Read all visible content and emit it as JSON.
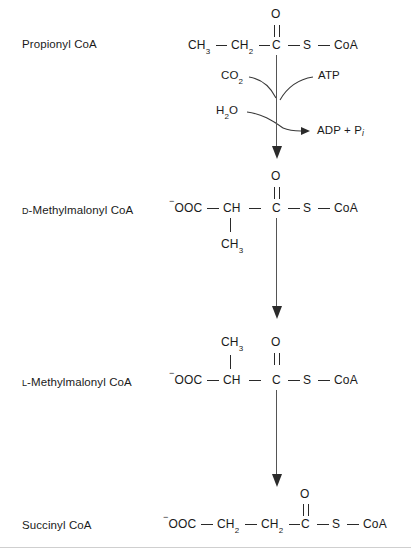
{
  "diagram": {
    "line_color": "#2a2a2a",
    "background": "#ffffff"
  },
  "compounds": [
    {
      "id": "propionyl",
      "label_prefix": "",
      "label": "Propionyl CoA"
    },
    {
      "id": "d-methylmalonyl",
      "label_prefix": "D",
      "label": "-Methylmalonyl CoA"
    },
    {
      "id": "l-methylmalonyl",
      "label_prefix": "L",
      "label": "-Methylmalonyl CoA"
    },
    {
      "id": "succinyl",
      "label_prefix": "",
      "label": "Succinyl CoA"
    }
  ],
  "structures": {
    "propionyl": {
      "carbonyl_oxygen": "O",
      "atoms": [
        "CH",
        "CH",
        "C",
        "S",
        "CoA"
      ],
      "atom_1": "CH",
      "atom_1_sub": "3",
      "atom_2": "CH",
      "atom_2_sub": "2",
      "atom_3": "C",
      "atom_4": "S",
      "atom_5": "CoA"
    },
    "d_methylmalonyl": {
      "carbonyl_oxygen": "O",
      "charge": "−",
      "atom_1": "OOC",
      "atom_2": "CH",
      "atom_3": "C",
      "atom_4": "S",
      "atom_5": "CoA",
      "branch": "CH",
      "branch_sub": "3"
    },
    "l_methylmalonyl": {
      "carbonyl_oxygen": "O",
      "charge": "−",
      "atom_1": "OOC",
      "atom_2": "CH",
      "atom_3": "C",
      "atom_4": "S",
      "atom_5": "CoA",
      "branch": "CH",
      "branch_sub": "3"
    },
    "succinyl": {
      "carbonyl_oxygen": "O",
      "charge": "−",
      "atom_1": "OOC",
      "atom_2": "CH",
      "atom_2_sub": "2",
      "atom_3": "CH",
      "atom_3_sub": "2",
      "atom_4": "C",
      "atom_5": "S",
      "atom_6": "CoA"
    }
  },
  "cofactors": {
    "co2": "CO",
    "co2_sub": "2",
    "water": "H",
    "water_sub": "2",
    "water_tail": "O",
    "atp": "ATP",
    "adp": "ADP + P",
    "adp_sub_italic": "i"
  }
}
